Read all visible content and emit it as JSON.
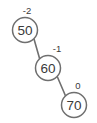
{
  "diagram": {
    "background_color": "#ffffff",
    "stroke_color": "#6f6f6f",
    "text_color": "#3a3a3a",
    "nodes": [
      {
        "id": "node-50",
        "value": "50",
        "balance_factor": "-2",
        "cx": 25,
        "cy": 30,
        "r": 12.5,
        "label_x": 27,
        "label_y": 10
      },
      {
        "id": "node-60",
        "value": "60",
        "balance_factor": "-1",
        "cx": 48,
        "cy": 68,
        "r": 12.5,
        "label_x": 57,
        "label_y": 48
      },
      {
        "id": "node-70",
        "value": "70",
        "balance_factor": "0",
        "cx": 74,
        "cy": 105,
        "r": 12.5,
        "label_x": 78,
        "label_y": 85
      }
    ],
    "edges": [
      {
        "id": "edge-50-60",
        "from": "node-50",
        "to": "node-60",
        "x1": 34,
        "y1": 39,
        "x2": 40,
        "y2": 60
      },
      {
        "id": "edge-60-70",
        "from": "node-60",
        "to": "node-70",
        "x1": 57,
        "y1": 76,
        "x2": 66,
        "y2": 97
      }
    ]
  }
}
